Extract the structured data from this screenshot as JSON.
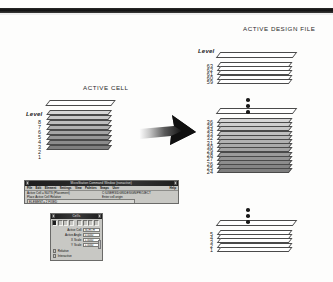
{
  "figure": {
    "active_cell_title": "ACTIVE CELL",
    "active_design_file_title": "ACTIVE DESIGN FILE",
    "level_label_left": "Level",
    "level_label_right": "Level",
    "arrow_icon": "right-arrow-icon"
  },
  "cell_stack": {
    "levels": [
      "8",
      "7",
      "6",
      "5",
      "4",
      "3",
      "2",
      "1"
    ]
  },
  "design_file_stack": {
    "group_top": [
      "63",
      "62",
      "61",
      "60",
      "59"
    ],
    "group_middle": [
      "36",
      "35",
      "34",
      "33",
      "32",
      "31",
      "30",
      "29",
      "28",
      "27",
      "26",
      "25",
      "24"
    ],
    "group_bottom": [
      "5",
      "4",
      "3",
      "2",
      "1"
    ],
    "ellipsis_icon": "vertical-ellipsis-icon"
  },
  "microstation_window": {
    "title": "MicroStation Command Window (nonactive)",
    "menu": [
      "File",
      "Edit",
      "Element",
      "Settings",
      "View",
      "Palettes",
      "Snaps",
      "User"
    ],
    "help_label": "Help",
    "status_left_1": "Active Cell = NUTS (Placement)",
    "status_left_2": "Place Active Cell Relative",
    "status_right_1": "C:\\USERS\\DGN\\DESIGN\\PROJECT",
    "status_right_2": "Enter cell origin",
    "command_field": "ELEMENT= 2 FIXED",
    "sysbtn_left_icon": "window-menu-icon",
    "sysbtn_right_icon": "window-close-icon"
  },
  "cell_dialog": {
    "title": "Cells",
    "fields": [
      {
        "label": "Active Cell",
        "value": "NORTH"
      },
      {
        "label": "Active Angle",
        "value": "0.0000"
      },
      {
        "label": "X Scale",
        "value": "1.0000"
      },
      {
        "label": "Y Scale",
        "value": "1.0000"
      }
    ],
    "checkboxes": [
      {
        "label": "Relative"
      },
      {
        "label": "Interactive"
      }
    ],
    "sysbtn_left_icon": "window-menu-icon",
    "sysbtn_right_icon": "window-close-icon",
    "scrollbar_icon": "vertical-scrollbar"
  },
  "colors": {
    "ink": "#1c1c1c",
    "rule": "#111111",
    "dialog_face": "#c8c8c4",
    "sheet_outline": "#4a4a4a"
  }
}
